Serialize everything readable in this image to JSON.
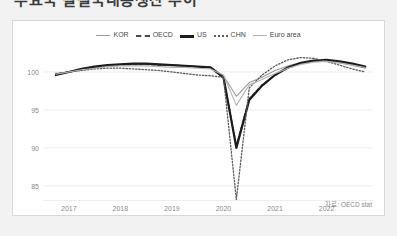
{
  "title_clipped": "주요국 실질국내총생산 추이",
  "source_note": "자료: OECD stat",
  "legend": {
    "items": [
      {
        "label": "KOR",
        "key": "k-solid-gray",
        "color": "#9a9a9a"
      },
      {
        "label": "OECD",
        "key": "k-dashed",
        "color": "#4a4a4a"
      },
      {
        "label": "US",
        "key": "k-thick",
        "color": "#1c1c1c"
      },
      {
        "label": "CHN",
        "key": "k-dotted",
        "color": "#5a5a5a"
      },
      {
        "label": "Euro area",
        "key": "k-solid-lgray",
        "color": "#b0b0b0"
      }
    ]
  },
  "chart_data": {
    "type": "line",
    "title": "주요국 실질국내총생산 추이",
    "xlabel": "",
    "ylabel": "",
    "ylim": [
      83,
      102.5
    ],
    "xlim": [
      2016.5,
      2022.9
    ],
    "yticks": [
      85,
      90,
      95,
      100
    ],
    "xticks": [
      2017,
      2018,
      2019,
      2020,
      2021,
      2022
    ],
    "grid": true,
    "legend_position": "top-center",
    "x": [
      2016.75,
      2017.0,
      2017.25,
      2017.5,
      2017.75,
      2018.0,
      2018.25,
      2018.5,
      2018.75,
      2019.0,
      2019.25,
      2019.5,
      2019.75,
      2020.0,
      2020.25,
      2020.5,
      2020.75,
      2021.0,
      2021.25,
      2021.5,
      2021.75,
      2022.0,
      2022.25,
      2022.5,
      2022.75
    ],
    "series": [
      {
        "name": "KOR",
        "values": [
          99.6,
          100.0,
          100.3,
          100.6,
          100.8,
          101.0,
          101.1,
          101.1,
          101.0,
          100.9,
          100.8,
          100.7,
          100.6,
          99.5,
          96.8,
          98.6,
          99.3,
          100.2,
          100.8,
          101.2,
          101.4,
          101.4,
          101.2,
          100.9,
          100.5
        ]
      },
      {
        "name": "OECD",
        "values": [
          99.7,
          100.0,
          100.3,
          100.6,
          100.8,
          100.9,
          101.0,
          101.0,
          100.9,
          100.9,
          100.8,
          100.7,
          100.6,
          99.2,
          90.3,
          96.5,
          98.3,
          99.6,
          100.5,
          101.1,
          101.4,
          101.5,
          101.3,
          101.0,
          100.6
        ]
      },
      {
        "name": "US",
        "values": [
          99.6,
          100.0,
          100.4,
          100.7,
          100.9,
          101.0,
          101.1,
          101.1,
          101.0,
          100.9,
          100.8,
          100.7,
          100.6,
          99.3,
          90.0,
          96.3,
          98.2,
          99.6,
          100.6,
          101.2,
          101.5,
          101.6,
          101.4,
          101.1,
          100.7
        ]
      },
      {
        "name": "CHN",
        "values": [
          99.8,
          100.0,
          100.2,
          100.4,
          100.5,
          100.5,
          100.4,
          100.3,
          100.2,
          100.0,
          99.8,
          99.6,
          99.5,
          99.3,
          83.2,
          97.9,
          99.6,
          100.8,
          101.6,
          101.9,
          101.8,
          101.4,
          100.9,
          100.4,
          100.0
        ]
      },
      {
        "name": "Euro area",
        "values": [
          99.7,
          100.0,
          100.3,
          100.5,
          100.7,
          100.8,
          100.8,
          100.8,
          100.7,
          100.6,
          100.6,
          100.5,
          100.4,
          99.6,
          95.6,
          98.3,
          99.0,
          99.8,
          100.5,
          101.0,
          101.3,
          101.4,
          101.2,
          100.9,
          100.6
        ]
      }
    ]
  }
}
